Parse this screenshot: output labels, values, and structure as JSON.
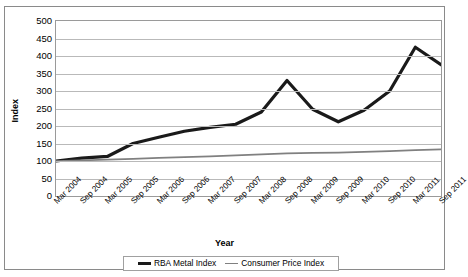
{
  "chart_data": {
    "type": "line",
    "title": "",
    "xlabel": "Year",
    "ylabel": "Index",
    "ylim": [
      0,
      500
    ],
    "ytick_step": 50,
    "grid": true,
    "legend_position": "bottom",
    "categories": [
      "Mar 2004",
      "Sep 2004",
      "Mar 2005",
      "Sep 2005",
      "Mar 2006",
      "Sep 2006",
      "Mar 2007",
      "Sep 2007",
      "Mar 2008",
      "Sep 2008",
      "Mar 2009",
      "Sep 2009",
      "Mar 2010",
      "Sep 2010",
      "Mar 2011",
      "Sep 2011"
    ],
    "yticks": [
      "0",
      "50",
      "100",
      "150",
      "200",
      "250",
      "300",
      "350",
      "400",
      "450",
      "500"
    ],
    "series": [
      {
        "name": "RBA Metal Index",
        "color": "#1a1a1a",
        "values": [
          100,
          108,
          113,
          150,
          168,
          185,
          196,
          205,
          240,
          330,
          248,
          212,
          245,
          300,
          425,
          375
        ]
      },
      {
        "name": "Consumer Price Index",
        "color": "#808080",
        "values": [
          100,
          102,
          104,
          106,
          109,
          111,
          113,
          116,
          119,
          122,
          123,
          124,
          126,
          128,
          131,
          133
        ]
      }
    ]
  },
  "legend": {
    "items": [
      {
        "label": "RBA Metal Index"
      },
      {
        "label": "Consumer Price Index"
      }
    ]
  }
}
